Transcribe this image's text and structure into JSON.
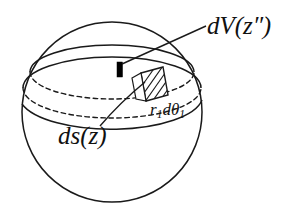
{
  "figure": {
    "background_color": "#ffffff",
    "stroke_color": "#1a1a1a",
    "hatch_color": "#1a1a1a",
    "marker_color": "#000000"
  },
  "labels": {
    "volume_element": {
      "text": "dV(z″)",
      "d": "d",
      "V": "V",
      "open_paren": "(",
      "z": "z",
      "primes": "″",
      "close_paren": ")"
    },
    "surface_element": {
      "text": "ds(z)",
      "d": "d",
      "s": "s",
      "open_paren": "(",
      "z": "z",
      "close_paren": ")"
    },
    "arc_length": {
      "text": "r₁dθ₁",
      "r": "r",
      "r_sub": "1",
      "d": "d",
      "theta": "θ",
      "theta_sub": "1"
    }
  },
  "geometry": {
    "sphere": {
      "cx": 112,
      "cy": 112,
      "r": 90
    },
    "band_upper_front_arc": "front edge of upper band boundary",
    "band_lower_front_arc": "front edge of lower band boundary",
    "dashed_ellipses": 2,
    "hatched_patch_lines": 7
  }
}
